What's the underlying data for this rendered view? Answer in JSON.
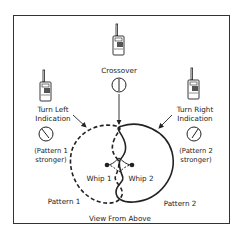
{
  "diagram": {
    "caption": "View From Above",
    "radios": {
      "left": {
        "label_line1": "Turn Left",
        "label_line2": "Indication",
        "note_line1": "(Pattern 1",
        "note_line2": "stronger)"
      },
      "center": {
        "label": "Crossover"
      },
      "right": {
        "label_line1": "Turn Right",
        "label_line2": "Indication",
        "note_line1": "(Pattern 2",
        "note_line2": "stronger)"
      }
    },
    "antennas": {
      "whip1": "Whip 1",
      "whip2": "Whip 2"
    },
    "patterns": {
      "pattern1": "Pattern 1",
      "pattern2": "Pattern 2"
    },
    "icons": [
      "walkie-talkie-icon",
      "meter-dial-icon"
    ],
    "colors": {
      "line": "#222222",
      "border": "#333333",
      "background": "#ffffff"
    }
  }
}
